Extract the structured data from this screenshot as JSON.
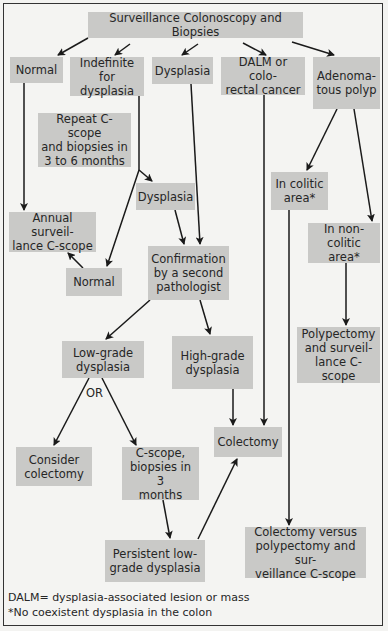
{
  "diagram": {
    "nodes": {
      "root": "Surveillance Colonoscopy and Biopsies",
      "normal_top": "Normal",
      "indefinite": "Indefinite\nfor dysplasia",
      "dysplasia_top": "Dysplasia",
      "dalm": "DALM or colo-\nrectal cancer",
      "adenomatous": "Adenoma-\ntous polyp",
      "repeat": "Repeat C-scope\nand biopsies in\n3 to 6 months",
      "dysplasia_mid": "Dysplasia",
      "annual": "Annual surveil-\nlance C-scope",
      "normal_mid": "Normal",
      "confirmation": "Confirmation\nby a second\npathologist",
      "colitic": "In colitic\narea*",
      "noncolitic": "In non-\ncolitic area*",
      "polypectomy": "Polypectomy\nand surveil-\nlance C-scope",
      "lowgrade": "Low-grade\ndysplasia",
      "highgrade": "High-grade\ndysplasia",
      "colectomy": "Colectomy",
      "consider": "Consider\ncolectomy",
      "cscope": "C-scope,\nbiopsies in 3\nmonths",
      "persistent": "Persistent low-\ngrade dysplasia",
      "versus": "Colectomy versus\npolypectomy and sur-\nveillance C-scope"
    },
    "or_label": "OR",
    "footnotes": {
      "dalm": "DALM= dysplasia-associated lesion or mass",
      "asterisk": "*No coexistent dysplasia in the colon"
    },
    "colors": {
      "box_fill": "#c9c9c7",
      "background": "#f4f4f2",
      "line": "#1a1a1a"
    }
  }
}
